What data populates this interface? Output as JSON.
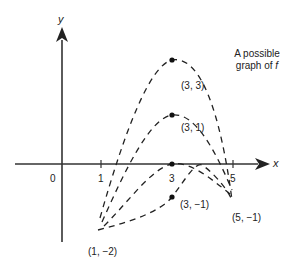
{
  "diagram": {
    "caption_line1": "A possible",
    "caption_line2_prefix": "graph of ",
    "caption_fn": "f",
    "axes": {
      "x_label": "x",
      "y_label": "y"
    },
    "ticks": {
      "origin": "0",
      "x1": "1",
      "x3": "3",
      "x5": "5"
    },
    "points": {
      "p33": "(3, 3)",
      "p31": "(3, 1)",
      "p3m1": "(3, −1)",
      "p1m2": "(1, −2)",
      "p5m1": "(5, −1)"
    },
    "colors": {
      "ink": "#222222",
      "background": "#ffffff"
    }
  }
}
